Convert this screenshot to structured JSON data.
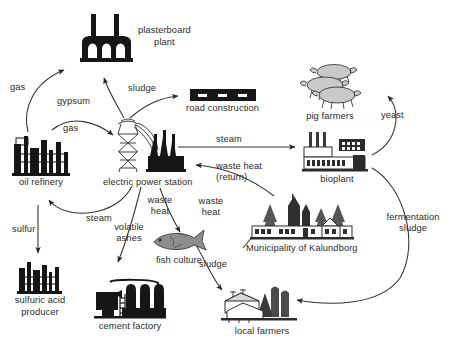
{
  "diagram": {
    "type": "flow-diagram",
    "background": "#ffffff",
    "line_color": "#333333",
    "text_color": "#2b2b2b"
  },
  "nodes": [
    {
      "id": "plasterboard_plant",
      "label": "plasterboard\nplant",
      "label_line1": "plasterboard",
      "label_line2": "plant",
      "icon": "factory-two-chimneys-icon"
    },
    {
      "id": "road_construction",
      "label": "road construction",
      "label_line1": "road construction",
      "label_line2": "",
      "icon": "road-bar-icon"
    },
    {
      "id": "pig_farmers",
      "label": "pig farmers",
      "label_line1": "pig farmers",
      "label_line2": "",
      "icon": "pigs-icon"
    },
    {
      "id": "oil_refinery",
      "label": "oil refinery",
      "label_line1": "oil refinery",
      "label_line2": "",
      "icon": "refinery-towers-icon"
    },
    {
      "id": "electric_power_station",
      "label": "electric power station",
      "label_line1": "electric power station",
      "label_line2": "",
      "icon": "pylon-power-plant-icon"
    },
    {
      "id": "bioplant",
      "label": "bioplant",
      "label_line1": "bioplant",
      "label_line2": "",
      "icon": "bioplant-building-icon"
    },
    {
      "id": "municipality",
      "label": "Municipality of Kalundborg",
      "label_line1": "Municipality of Kalundborg",
      "label_line2": "",
      "icon": "town-church-trees-icon"
    },
    {
      "id": "fish_culture",
      "label": "fish culture",
      "label_line1": "fish culture",
      "label_line2": "",
      "icon": "fish-icon"
    },
    {
      "id": "sulfuric_acid",
      "label": "sulfuric acid\nproducer",
      "label_line1": "sulfuric acid",
      "label_line2": "producer",
      "icon": "acid-plant-icon"
    },
    {
      "id": "cement_factory",
      "label": "cement factory",
      "label_line1": "cement factory",
      "label_line2": "",
      "icon": "cement-silos-icon"
    },
    {
      "id": "local_farmers",
      "label": "local farmers",
      "label_line1": "local farmers",
      "label_line2": "",
      "icon": "farm-barn-silo-icon"
    }
  ],
  "edges": [
    {
      "id": "e_gas_plasterboard",
      "label": "gas",
      "from": "oil_refinery",
      "to": "plasterboard_plant"
    },
    {
      "id": "e_gypsum",
      "label": "gypsum",
      "from": "electric_power_station",
      "to": "plasterboard_plant"
    },
    {
      "id": "e_sludge_road",
      "label": "sludge",
      "from": "electric_power_station",
      "to": "road_construction"
    },
    {
      "id": "e_gas_power",
      "label": "gas",
      "from": "oil_refinery",
      "to": "electric_power_station"
    },
    {
      "id": "e_steam_bioplant",
      "label": "steam",
      "from": "electric_power_station",
      "to": "bioplant"
    },
    {
      "id": "e_waste_heat_return",
      "label": "waste heat\n(return)",
      "label_line1": "waste heat",
      "label_line2": "(return)",
      "from": "municipality",
      "to": "electric_power_station"
    },
    {
      "id": "e_steam_refinery",
      "label": "steam",
      "from": "electric_power_station",
      "to": "oil_refinery"
    },
    {
      "id": "e_volatile_ashes",
      "label": "volatile\nashes",
      "label_line1": "volatile",
      "label_line2": "ashes",
      "from": "electric_power_station",
      "to": "cement_factory"
    },
    {
      "id": "e_waste_heat_fish",
      "label": "waste\nheat",
      "label_line1": "waste",
      "label_line2": "heat",
      "from": "electric_power_station",
      "to": "fish_culture"
    },
    {
      "id": "e_waste_heat_muni",
      "label": "waste\nheat",
      "label_line1": "waste",
      "label_line2": "heat",
      "from": "electric_power_station",
      "to": "municipality"
    },
    {
      "id": "e_sulfur",
      "label": "sulfur",
      "from": "oil_refinery",
      "to": "sulfuric_acid"
    },
    {
      "id": "e_yeast",
      "label": "yeast",
      "from": "bioplant",
      "to": "pig_farmers"
    },
    {
      "id": "e_fermentation_sludge",
      "label": "fermentation\nsludge",
      "label_line1": "fermentation",
      "label_line2": "sludge",
      "from": "bioplant",
      "to": "local_farmers"
    },
    {
      "id": "e_sludge_local",
      "label": "sludge",
      "from": "fish_culture",
      "to": "local_farmers"
    }
  ]
}
